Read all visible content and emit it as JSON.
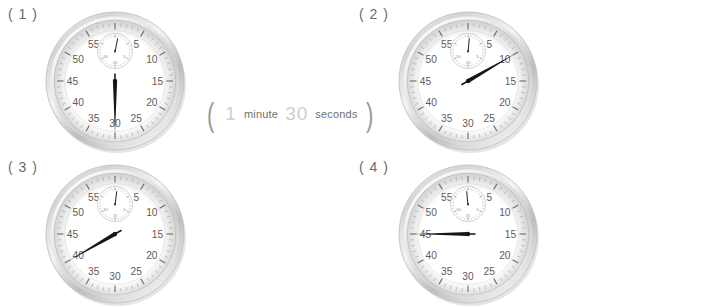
{
  "page": {
    "background": "#ffffff",
    "text_color": "#6b6b6b",
    "answer_fill_color": "#cfcfcf"
  },
  "worksheet": {
    "items": [
      {
        "label": "( 1 )",
        "clock": {
          "name": "stopwatch-1",
          "second_hand_value": 30,
          "second_hand_angle_deg": 180,
          "minute_subdial_value": 1,
          "minute_subdial_angle_deg": 12,
          "dial_numbers": [
            60,
            5,
            10,
            15,
            20,
            25,
            30,
            35,
            40,
            45,
            50,
            55
          ],
          "subdial_numbers": [
            15,
            5,
            10
          ],
          "bezel_color": "#d9d9d9",
          "face_color": "#ffffff",
          "hand_color": "#161616"
        },
        "answer": {
          "open_paren": "(",
          "minutes_value": "1",
          "minute_unit": "minute",
          "seconds_value": "30",
          "seconds_unit": "seconds",
          "close_paren": ")",
          "filled": true
        }
      },
      {
        "label": "( 2 )",
        "clock": {
          "name": "stopwatch-2",
          "second_hand_value": 10,
          "second_hand_angle_deg": 60,
          "minute_subdial_value": 1,
          "minute_subdial_angle_deg": 6,
          "dial_numbers": [
            60,
            5,
            10,
            15,
            20,
            25,
            30,
            35,
            40,
            45,
            50,
            55
          ],
          "subdial_numbers": [
            15,
            5,
            10
          ],
          "bezel_color": "#d9d9d9",
          "face_color": "#ffffff",
          "hand_color": "#161616"
        },
        "answer": {
          "open_paren": "(",
          "minutes_value": "1",
          "minute_unit": "minute",
          "seconds_value": "10",
          "seconds_unit": "seconds",
          "close_paren": ")",
          "filled": true
        }
      },
      {
        "label": "( 3 )",
        "clock": {
          "name": "stopwatch-3",
          "second_hand_value": 40,
          "second_hand_angle_deg": 240,
          "minute_subdial_value": 1,
          "minute_subdial_angle_deg": 8,
          "dial_numbers": [
            60,
            5,
            10,
            15,
            20,
            25,
            30,
            35,
            40,
            45,
            50,
            55
          ],
          "subdial_numbers": [
            15,
            5,
            10
          ],
          "bezel_color": "#d9d9d9",
          "face_color": "#ffffff",
          "hand_color": "#161616"
        },
        "answer": {
          "open_paren": "(",
          "minutes_value": "",
          "minute_unit": "minute",
          "seconds_value": "",
          "seconds_unit": "seconds",
          "close_paren": ")",
          "filled": false
        }
      },
      {
        "label": "( 4 )",
        "clock": {
          "name": "stopwatch-4",
          "second_hand_value": 45,
          "second_hand_angle_deg": 270,
          "minute_subdial_value": 1,
          "minute_subdial_angle_deg": -6,
          "dial_numbers": [
            60,
            5,
            10,
            15,
            20,
            25,
            30,
            35,
            40,
            45,
            50,
            55
          ],
          "subdial_numbers": [
            15,
            5,
            10
          ],
          "bezel_color": "#d9d9d9",
          "face_color": "#ffffff",
          "hand_color": "#161616"
        },
        "answer": {
          "open_paren": "(",
          "minutes_value": "",
          "minute_unit": "minute",
          "seconds_value": "",
          "seconds_unit": "seconds",
          "close_paren": ")",
          "filled": false
        }
      }
    ]
  }
}
